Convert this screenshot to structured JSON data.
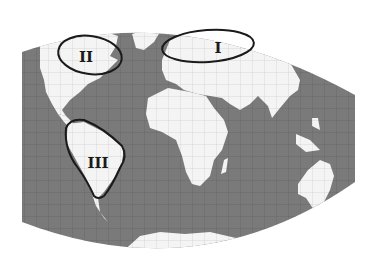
{
  "map": {
    "type": "world map (curved projection, grayscale)",
    "colors": {
      "ocean": "#7a7a7a",
      "land": "#f4f4f4",
      "grid": "#5e5e5e",
      "outline": "#1a1a1a",
      "background": "#ffffff"
    },
    "regions": [
      {
        "id": "I",
        "label": "I",
        "area": "Northern Europe / Northern Russia"
      },
      {
        "id": "II",
        "label": "II",
        "area": "Northeastern North America / Canada"
      },
      {
        "id": "III",
        "label": "III",
        "area": "South America (Amazon / Brazil)"
      }
    ]
  }
}
